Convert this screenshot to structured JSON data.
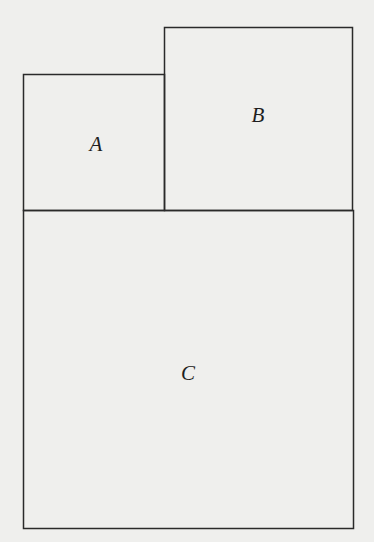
{
  "diagram": {
    "type": "rectangle-partition",
    "background": "#efefed",
    "stroke_color": "#2a2a2a",
    "regions": [
      {
        "id": "A",
        "label": "A",
        "x": 23,
        "y": 74,
        "width": 141,
        "height": 136,
        "label_x": 96,
        "label_y": 144
      },
      {
        "id": "B",
        "label": "B",
        "x": 164,
        "y": 27,
        "width": 188,
        "height": 183,
        "label_x": 258,
        "label_y": 115
      },
      {
        "id": "C",
        "label": "C",
        "x": 23,
        "y": 210,
        "width": 330,
        "height": 318,
        "label_x": 188,
        "label_y": 373
      }
    ]
  }
}
